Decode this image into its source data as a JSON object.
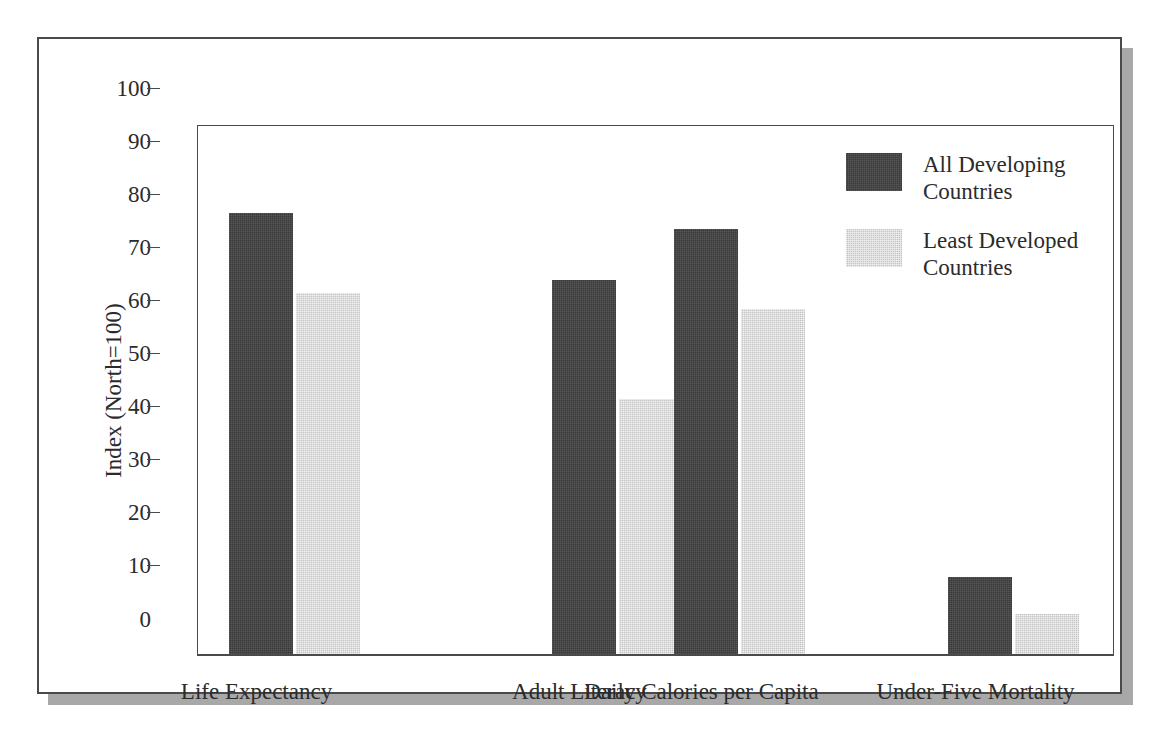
{
  "chart_data": {
    "type": "bar",
    "title": "",
    "xlabel": "",
    "ylabel": "Index (North=100)",
    "ylim": [
      0,
      100
    ],
    "yticks": [
      0,
      10,
      20,
      30,
      40,
      50,
      60,
      70,
      80,
      90,
      100
    ],
    "ytick_labels": [
      "0",
      "10",
      "20",
      "30",
      "40",
      "50",
      "60",
      "70",
      "80",
      "90",
      "100"
    ],
    "grid": false,
    "legend_position": "top-right",
    "categories": [
      "Life Expectancy",
      "Adult Literacy",
      "Daily Calories per Capita",
      "Under-Five Mortality"
    ],
    "series": [
      {
        "name": "All Developing Countries",
        "color": "#3a3a3a",
        "values": [
          83,
          70.5,
          80,
          14.5
        ]
      },
      {
        "name": "Least Developed Countries",
        "color": "#c4c4c4",
        "values": [
          68,
          48,
          65,
          7.5
        ]
      }
    ]
  },
  "legend": {
    "entries": [
      {
        "label": "All Developing\nCountries",
        "color": "#3a3a3a"
      },
      {
        "label": "Least Developed\nCountries",
        "color": "#c4c4c4"
      }
    ]
  },
  "colors": {
    "frame": "#4a4a4a",
    "shadow": "#a8a8a8",
    "text": "#2b2b2b",
    "background": "#ffffff"
  }
}
